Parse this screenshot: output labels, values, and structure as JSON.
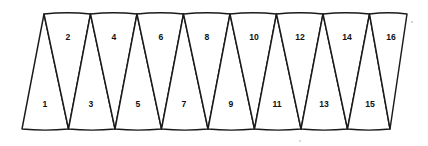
{
  "figure": {
    "triangle_count": 16,
    "stroke_color": "#1a1a1a",
    "fill_color": "#ffffff",
    "background_color": "#ffffff",
    "label_color": "#111111"
  },
  "geometry": {
    "top_vertices_x": [
      44,
      90.5,
      137,
      183.5,
      230,
      276.5,
      323,
      369.5,
      407
    ],
    "bottom_vertices_x": [
      22,
      68.5,
      115,
      161.5,
      208,
      254.5,
      301,
      347.5,
      390
    ],
    "top_y": 14,
    "bottom_y": 129
  },
  "triangles": [
    {
      "id": 1,
      "label": "1",
      "orientation": "up",
      "label_x": 45,
      "label_y": 105
    },
    {
      "id": 2,
      "label": "2",
      "orientation": "down",
      "label_x": 68,
      "label_y": 38
    },
    {
      "id": 3,
      "label": "3",
      "orientation": "up",
      "label_x": 91,
      "label_y": 105
    },
    {
      "id": 4,
      "label": "4",
      "orientation": "down",
      "label_x": 114,
      "label_y": 38
    },
    {
      "id": 5,
      "label": "5",
      "orientation": "up",
      "label_x": 138,
      "label_y": 105
    },
    {
      "id": 6,
      "label": "6",
      "orientation": "down",
      "label_x": 161,
      "label_y": 38
    },
    {
      "id": 7,
      "label": "7",
      "orientation": "up",
      "label_x": 184,
      "label_y": 105
    },
    {
      "id": 8,
      "label": "8",
      "orientation": "down",
      "label_x": 207,
      "label_y": 38
    },
    {
      "id": 9,
      "label": "9",
      "orientation": "up",
      "label_x": 231,
      "label_y": 105
    },
    {
      "id": 10,
      "label": "10",
      "orientation": "down",
      "label_x": 254,
      "label_y": 38
    },
    {
      "id": 11,
      "label": "11",
      "orientation": "up",
      "label_x": 277,
      "label_y": 105
    },
    {
      "id": 12,
      "label": "12",
      "orientation": "down",
      "label_x": 300,
      "label_y": 38
    },
    {
      "id": 13,
      "label": "13",
      "orientation": "up",
      "label_x": 324,
      "label_y": 105
    },
    {
      "id": 14,
      "label": "14",
      "orientation": "down",
      "label_x": 347,
      "label_y": 38
    },
    {
      "id": 15,
      "label": "15",
      "orientation": "up",
      "label_x": 370,
      "label_y": 105
    },
    {
      "id": 16,
      "label": "16",
      "orientation": "down",
      "label_x": 391,
      "label_y": 38
    }
  ]
}
